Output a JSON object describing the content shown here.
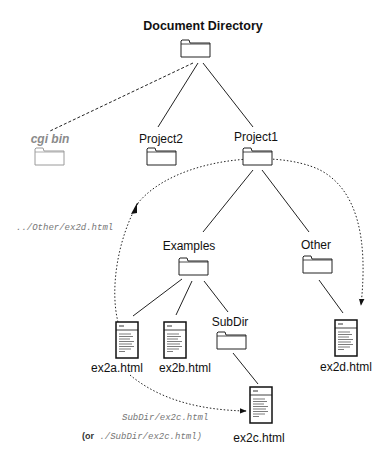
{
  "diagram": {
    "title": "Document Directory",
    "nodes": {
      "root": {
        "label": "Document Directory",
        "type": "folder"
      },
      "cgi_bin": {
        "label": "cgi bin",
        "type": "folder",
        "style": "greyed"
      },
      "project2": {
        "label": "Project2",
        "type": "folder"
      },
      "project1": {
        "label": "Project1",
        "type": "folder"
      },
      "examples": {
        "label": "Examples",
        "type": "folder"
      },
      "other": {
        "label": "Other",
        "type": "folder"
      },
      "subdir": {
        "label": "SubDir",
        "type": "folder"
      },
      "ex2a": {
        "label": "ex2a.html",
        "type": "document"
      },
      "ex2b": {
        "label": "ex2b.html",
        "type": "document"
      },
      "ex2c": {
        "label": "ex2c.html",
        "type": "document"
      },
      "ex2d": {
        "label": "ex2d.html",
        "type": "document"
      }
    },
    "edges": [
      {
        "from": "root",
        "to": "cgi_bin",
        "style": "dashed"
      },
      {
        "from": "root",
        "to": "project2",
        "style": "solid"
      },
      {
        "from": "root",
        "to": "project1",
        "style": "solid"
      },
      {
        "from": "project1",
        "to": "examples",
        "style": "solid"
      },
      {
        "from": "project1",
        "to": "other",
        "style": "solid"
      },
      {
        "from": "examples",
        "to": "ex2a",
        "style": "solid"
      },
      {
        "from": "examples",
        "to": "ex2b",
        "style": "solid"
      },
      {
        "from": "examples",
        "to": "subdir",
        "style": "solid"
      },
      {
        "from": "subdir",
        "to": "ex2c",
        "style": "solid"
      },
      {
        "from": "other",
        "to": "ex2d",
        "style": "solid"
      }
    ],
    "relative_links": {
      "ex2a_to_ex2d": {
        "path": "../Other/ex2d.html",
        "style": "dotted-arrow"
      },
      "ex2a_to_ex2c": {
        "path": "SubDir/ex2c.html",
        "alt_prefix": "(or",
        "alt_path": "./SubDir/ex2c.html)",
        "style": "dotted-arrow"
      }
    },
    "colors": {
      "line": "#222222",
      "greyed": "#8a8a8a",
      "code_text": "#777777"
    }
  }
}
